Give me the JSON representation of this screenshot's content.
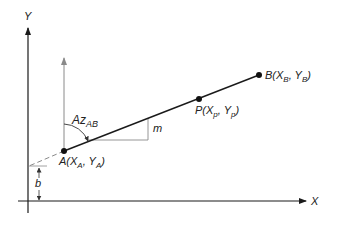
{
  "diagram": {
    "axes": {
      "x_label": "X",
      "y_label": "Y"
    },
    "points": {
      "A": {
        "name": "A",
        "x_sub": "A",
        "y_sub": "A",
        "label_prefix": "A(X",
        "label_mid": ", Y",
        "label_end": ")"
      },
      "B": {
        "name": "B",
        "x_sub": "B",
        "y_sub": "B",
        "label_prefix": "B(X",
        "label_mid": ", Y",
        "label_end": ")"
      },
      "P": {
        "name": "P",
        "x_sub": "p",
        "y_sub": "p",
        "label_prefix": "P(X",
        "label_mid": ", Y",
        "label_end": ")"
      }
    },
    "azimuth": {
      "main": "Az",
      "sub": "AB"
    },
    "slope_label": "m",
    "intercept_label": "b",
    "colors": {
      "line": "#1a1a1a",
      "gray_line": "#8a8a8a",
      "text": "#222222"
    }
  }
}
